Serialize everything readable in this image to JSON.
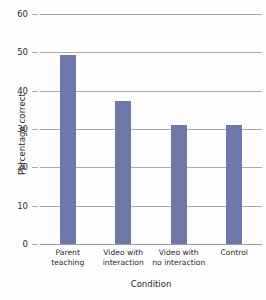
{
  "chart_data": {
    "type": "bar",
    "title": "",
    "xlabel": "Condition",
    "ylabel": "Percentage correct",
    "categories": [
      "Parent\nteaching",
      "Video with\ninteraction",
      "Video with\nno interaction",
      "Control"
    ],
    "values": [
      49.3,
      37.3,
      31.1,
      31.0
    ],
    "ylim": [
      0,
      60
    ],
    "yticks": [
      0,
      10,
      20,
      30,
      40,
      50,
      60
    ],
    "ytick_labels": [
      "0",
      "10",
      "20",
      "30",
      "40",
      "50",
      "60"
    ],
    "grid": true,
    "legend": false,
    "bar_color": "#6d77a9",
    "gridline_color": "#a9a9a9",
    "background_color": "#fdfdfd",
    "text_color": "#2b2b2b"
  }
}
